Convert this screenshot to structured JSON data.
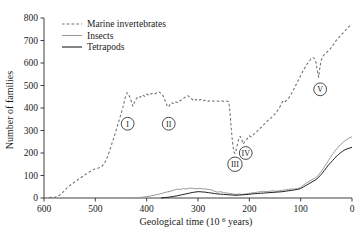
{
  "chart_data": {
    "type": "line",
    "title": "",
    "xlabel": "Geological time (10⁶ years)",
    "ylabel": "Number of families",
    "xlim": [
      600,
      0
    ],
    "ylim": [
      0,
      800
    ],
    "x_reversed": true,
    "grid": false,
    "legend_position": "top-left",
    "xticks": [
      600,
      500,
      400,
      300,
      200,
      100,
      0
    ],
    "xticklabels": [
      "600",
      "500",
      "400",
      "300",
      "200",
      "100",
      "0"
    ],
    "yticks": [
      0,
      100,
      200,
      300,
      400,
      500,
      600,
      700,
      800
    ],
    "yticklabels": [
      "0",
      "100",
      "200",
      "300",
      "400",
      "500",
      "600",
      "700",
      "800"
    ],
    "series": [
      {
        "name": "Marine invertebrates",
        "style": "dashed",
        "color": "#6e6e6e",
        "points": [
          [
            590,
            2
          ],
          [
            578,
            4
          ],
          [
            570,
            12
          ],
          [
            562,
            28
          ],
          [
            554,
            48
          ],
          [
            546,
            62
          ],
          [
            538,
            75
          ],
          [
            530,
            88
          ],
          [
            522,
            100
          ],
          [
            514,
            112
          ],
          [
            506,
            124
          ],
          [
            500,
            130
          ],
          [
            494,
            133
          ],
          [
            488,
            138
          ],
          [
            482,
            155
          ],
          [
            476,
            185
          ],
          [
            470,
            225
          ],
          [
            464,
            268
          ],
          [
            458,
            312
          ],
          [
            452,
            358
          ],
          [
            446,
            405
          ],
          [
            442,
            445
          ],
          [
            438,
            468
          ],
          [
            434,
            455
          ],
          [
            430,
            430
          ],
          [
            427,
            408
          ],
          [
            424,
            424
          ],
          [
            420,
            442
          ],
          [
            416,
            452
          ],
          [
            412,
            448
          ],
          [
            408,
            458
          ],
          [
            404,
            452
          ],
          [
            400,
            462
          ],
          [
            396,
            456
          ],
          [
            392,
            462
          ],
          [
            388,
            466
          ],
          [
            384,
            462
          ],
          [
            380,
            468
          ],
          [
            376,
            472
          ],
          [
            372,
            465
          ],
          [
            368,
            455
          ],
          [
            364,
            432
          ],
          [
            360,
            410
          ],
          [
            357,
            404
          ],
          [
            355,
            414
          ],
          [
            352,
            424
          ],
          [
            348,
            420
          ],
          [
            344,
            428
          ],
          [
            340,
            424
          ],
          [
            335,
            432
          ],
          [
            330,
            440
          ],
          [
            325,
            448
          ],
          [
            320,
            455
          ],
          [
            316,
            448
          ],
          [
            312,
            440
          ],
          [
            308,
            432
          ],
          [
            304,
            438
          ],
          [
            300,
            432
          ],
          [
            295,
            438
          ],
          [
            290,
            432
          ],
          [
            285,
            436
          ],
          [
            280,
            430
          ],
          [
            275,
            434
          ],
          [
            270,
            430
          ],
          [
            265,
            432
          ],
          [
            260,
            430
          ],
          [
            255,
            432
          ],
          [
            250,
            430
          ],
          [
            246,
            432
          ],
          [
            243,
            430
          ],
          [
            240,
            428
          ],
          [
            238,
            390
          ],
          [
            236,
            330
          ],
          [
            234,
            276
          ],
          [
            232,
            232
          ],
          [
            230,
            205
          ],
          [
            228,
            198
          ],
          [
            226,
            210
          ],
          [
            224,
            232
          ],
          [
            221,
            258
          ],
          [
            218,
            274
          ],
          [
            215,
            262
          ],
          [
            212,
            240
          ],
          [
            209,
            250
          ],
          [
            206,
            256
          ],
          [
            203,
            268
          ],
          [
            200,
            276
          ],
          [
            196,
            272
          ],
          [
            192,
            282
          ],
          [
            188,
            290
          ],
          [
            184,
            298
          ],
          [
            180,
            308
          ],
          [
            175,
            318
          ],
          [
            170,
            330
          ],
          [
            165,
            342
          ],
          [
            160,
            352
          ],
          [
            155,
            362
          ],
          [
            150,
            374
          ],
          [
            146,
            386
          ],
          [
            142,
            398
          ],
          [
            139,
            412
          ],
          [
            136,
            426
          ],
          [
            134,
            432
          ],
          [
            131,
            428
          ],
          [
            128,
            432
          ],
          [
            124,
            442
          ],
          [
            120,
            456
          ],
          [
            116,
            472
          ],
          [
            112,
            490
          ],
          [
            108,
            508
          ],
          [
            104,
            526
          ],
          [
            100,
            544
          ],
          [
            96,
            562
          ],
          [
            92,
            578
          ],
          [
            88,
            594
          ],
          [
            84,
            606
          ],
          [
            80,
            618
          ],
          [
            76,
            624
          ],
          [
            72,
            618
          ],
          [
            70,
            600
          ],
          [
            68,
            572
          ],
          [
            66,
            548
          ],
          [
            65,
            536
          ],
          [
            64,
            556
          ],
          [
            62,
            588
          ],
          [
            60,
            612
          ],
          [
            57,
            628
          ],
          [
            54,
            638
          ],
          [
            50,
            646
          ],
          [
            46,
            654
          ],
          [
            42,
            664
          ],
          [
            38,
            676
          ],
          [
            34,
            690
          ],
          [
            30,
            702
          ],
          [
            26,
            712
          ],
          [
            22,
            722
          ],
          [
            18,
            732
          ],
          [
            14,
            742
          ],
          [
            10,
            752
          ],
          [
            6,
            762
          ],
          [
            2,
            770
          ],
          [
            0,
            772
          ]
        ]
      },
      {
        "name": "Insects",
        "style": "solid",
        "color": "#9a9a9a",
        "points": [
          [
            432,
            0
          ],
          [
            420,
            1
          ],
          [
            410,
            3
          ],
          [
            400,
            6
          ],
          [
            392,
            9
          ],
          [
            384,
            13
          ],
          [
            376,
            17
          ],
          [
            368,
            22
          ],
          [
            360,
            27
          ],
          [
            352,
            31
          ],
          [
            345,
            36
          ],
          [
            340,
            40
          ],
          [
            334,
            38
          ],
          [
            328,
            42
          ],
          [
            322,
            40
          ],
          [
            316,
            44
          ],
          [
            310,
            43
          ],
          [
            304,
            41
          ],
          [
            298,
            43
          ],
          [
            292,
            41
          ],
          [
            286,
            40
          ],
          [
            280,
            38
          ],
          [
            274,
            36
          ],
          [
            268,
            30
          ],
          [
            262,
            26
          ],
          [
            256,
            28
          ],
          [
            250,
            24
          ],
          [
            244,
            22
          ],
          [
            238,
            20
          ],
          [
            232,
            18
          ],
          [
            226,
            16
          ],
          [
            220,
            18
          ],
          [
            214,
            16
          ],
          [
            208,
            18
          ],
          [
            202,
            20
          ],
          [
            196,
            22
          ],
          [
            190,
            24
          ],
          [
            184,
            26
          ],
          [
            178,
            28
          ],
          [
            172,
            30
          ],
          [
            166,
            28
          ],
          [
            160,
            30
          ],
          [
            154,
            32
          ],
          [
            148,
            30
          ],
          [
            142,
            32
          ],
          [
            136,
            34
          ],
          [
            130,
            36
          ],
          [
            124,
            38
          ],
          [
            118,
            40
          ],
          [
            112,
            40
          ],
          [
            106,
            42
          ],
          [
            100,
            48
          ],
          [
            94,
            58
          ],
          [
            88,
            68
          ],
          [
            82,
            76
          ],
          [
            76,
            84
          ],
          [
            70,
            92
          ],
          [
            66,
            100
          ],
          [
            62,
            112
          ],
          [
            58,
            124
          ],
          [
            54,
            138
          ],
          [
            50,
            152
          ],
          [
            46,
            166
          ],
          [
            42,
            180
          ],
          [
            38,
            194
          ],
          [
            34,
            206
          ],
          [
            30,
            218
          ],
          [
            26,
            228
          ],
          [
            22,
            238
          ],
          [
            18,
            246
          ],
          [
            14,
            254
          ],
          [
            10,
            260
          ],
          [
            6,
            266
          ],
          [
            2,
            270
          ],
          [
            0,
            272
          ]
        ]
      },
      {
        "name": "Tetrapods",
        "style": "solid",
        "color": "#1f1f1f",
        "points": [
          [
            372,
            0
          ],
          [
            364,
            2
          ],
          [
            356,
            4
          ],
          [
            348,
            7
          ],
          [
            340,
            10
          ],
          [
            332,
            14
          ],
          [
            324,
            18
          ],
          [
            316,
            22
          ],
          [
            310,
            25
          ],
          [
            304,
            27
          ],
          [
            298,
            28
          ],
          [
            292,
            27
          ],
          [
            286,
            26
          ],
          [
            280,
            24
          ],
          [
            274,
            22
          ],
          [
            268,
            20
          ],
          [
            262,
            18
          ],
          [
            256,
            17
          ],
          [
            250,
            16
          ],
          [
            244,
            15
          ],
          [
            238,
            14
          ],
          [
            232,
            13
          ],
          [
            226,
            12
          ],
          [
            220,
            13
          ],
          [
            214,
            14
          ],
          [
            208,
            15
          ],
          [
            202,
            16
          ],
          [
            196,
            18
          ],
          [
            190,
            19
          ],
          [
            184,
            20
          ],
          [
            178,
            21
          ],
          [
            172,
            22
          ],
          [
            166,
            23
          ],
          [
            160,
            24
          ],
          [
            154,
            25
          ],
          [
            148,
            26
          ],
          [
            142,
            27
          ],
          [
            136,
            28
          ],
          [
            130,
            30
          ],
          [
            124,
            32
          ],
          [
            118,
            34
          ],
          [
            112,
            36
          ],
          [
            106,
            38
          ],
          [
            100,
            42
          ],
          [
            94,
            50
          ],
          [
            88,
            58
          ],
          [
            82,
            66
          ],
          [
            76,
            74
          ],
          [
            70,
            82
          ],
          [
            66,
            90
          ],
          [
            62,
            100
          ],
          [
            58,
            110
          ],
          [
            54,
            122
          ],
          [
            50,
            134
          ],
          [
            46,
            146
          ],
          [
            42,
            156
          ],
          [
            38,
            166
          ],
          [
            34,
            176
          ],
          [
            30,
            186
          ],
          [
            26,
            194
          ],
          [
            22,
            202
          ],
          [
            18,
            208
          ],
          [
            14,
            214
          ],
          [
            10,
            218
          ],
          [
            6,
            221
          ],
          [
            2,
            224
          ],
          [
            0,
            225
          ]
        ]
      }
    ],
    "annotations": [
      {
        "label": "I",
        "x": 437,
        "y": 330
      },
      {
        "label": "II",
        "x": 357,
        "y": 330
      },
      {
        "label": "III",
        "x": 228,
        "y": 150
      },
      {
        "label": "IV",
        "x": 207,
        "y": 200
      },
      {
        "label": "V",
        "x": 62,
        "y": 483
      }
    ]
  },
  "legend": {
    "items": [
      {
        "label": "Marine invertebrates"
      },
      {
        "label": "Insects"
      },
      {
        "label": "Tetrapods"
      }
    ]
  }
}
